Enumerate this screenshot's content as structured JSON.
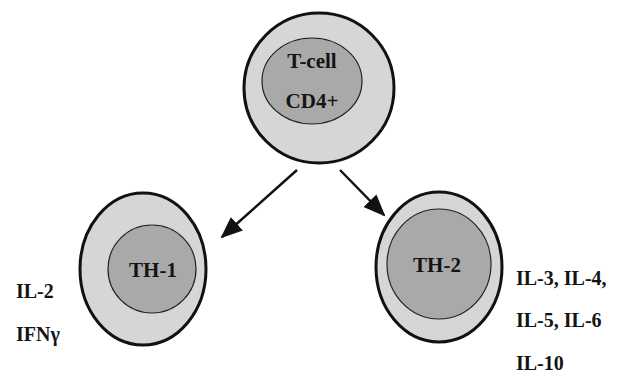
{
  "diagram": {
    "parent_cell": {
      "line1": "T-cell",
      "line2": "CD4+"
    },
    "children": [
      {
        "label": "TH-1",
        "cytokines": [
          "IL-2",
          "IFNγ"
        ]
      },
      {
        "label": "TH-2",
        "cytokines": [
          "IL-3, IL-4,",
          "IL-5, IL-6",
          "IL-10"
        ]
      }
    ],
    "colors": {
      "outer_fill": "#d6d6d6",
      "inner_fill": "#a9a9a9",
      "stroke": "#111111",
      "text": "#141414"
    }
  }
}
